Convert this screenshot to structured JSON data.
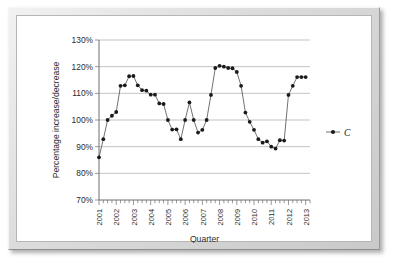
{
  "chart_data": {
    "type": "scatter",
    "title": "",
    "xlabel": "Quarter",
    "ylabel": "Percentage increase/decrease",
    "ylim": [
      70,
      130
    ],
    "ytick_labels": [
      "70%",
      "80%",
      "90%",
      "100%",
      "110%",
      "120%",
      "130%"
    ],
    "ytick_values": [
      70,
      80,
      90,
      100,
      110,
      120,
      130
    ],
    "xtick_labels": [
      "2001",
      "2002",
      "2003",
      "2004",
      "2005",
      "2006",
      "2007",
      "2008",
      "2009",
      "2010",
      "2011",
      "2012",
      "2013"
    ],
    "xtick_values": [
      2001,
      2002,
      2003,
      2004,
      2005,
      2006,
      2007,
      2008,
      2009,
      2010,
      2011,
      2012,
      2013
    ],
    "x_minor_ticks_per_year": 4,
    "grid": "horizontal",
    "legend_position": "right",
    "series": [
      {
        "name": "C",
        "marker": "filled-circle",
        "color": "#1a1a1a",
        "x": [
          2001.0,
          2001.25,
          2001.5,
          2001.75,
          2002.0,
          2002.25,
          2002.5,
          2002.75,
          2003.0,
          2003.25,
          2003.5,
          2003.75,
          2004.0,
          2004.25,
          2004.5,
          2004.75,
          2005.0,
          2005.25,
          2005.5,
          2005.75,
          2006.0,
          2006.25,
          2006.5,
          2006.75,
          2007.0,
          2007.25,
          2007.5,
          2007.75,
          2008.0,
          2008.25,
          2008.5,
          2008.75,
          2009.0,
          2009.25,
          2009.5,
          2009.75,
          2010.0,
          2010.25,
          2010.5,
          2010.75,
          2011.0,
          2011.25,
          2011.5,
          2011.75,
          2012.0,
          2012.25,
          2012.5,
          2012.75,
          2013.0
        ],
        "values": [
          86.0,
          92.8,
          100.0,
          101.6,
          103.0,
          112.8,
          113.0,
          116.4,
          116.5,
          113.0,
          111.2,
          111.0,
          109.5,
          109.5,
          106.2,
          106.0,
          100.0,
          96.4,
          96.5,
          92.8,
          100.0,
          106.6,
          100.0,
          95.3,
          96.3,
          100.0,
          109.4,
          119.5,
          120.3,
          120.0,
          119.5,
          119.4,
          118.0,
          112.8,
          102.8,
          99.3,
          96.3,
          92.8,
          91.5,
          92.0,
          90.0,
          89.3,
          92.4,
          92.3,
          109.4,
          112.8,
          116.1,
          116.1,
          116.1
        ]
      }
    ],
    "legend": [
      {
        "label": "C",
        "marker": "filled-circle",
        "color": "#1a1a1a"
      }
    ]
  },
  "legend": {
    "entry_label": "C"
  },
  "axes": {
    "x_title": "Quarter",
    "y_title": "Percentage increase/decrease"
  }
}
